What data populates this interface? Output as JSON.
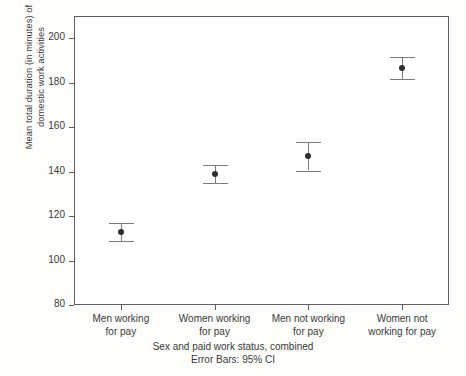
{
  "chart_data": {
    "type": "scatter",
    "title": "",
    "xlabel": "Sex and paid work status, combined",
    "ylabel": "Mean total duration (in minutes) of domestic work activities",
    "ylabel_line1": "Mean total duration (in minutes) of",
    "ylabel_line2": "domestic work activities",
    "error_note": "Error Bars: 95% CI",
    "categories": [
      "Men working\nfor pay",
      "Women working\nfor pay",
      "Men not working\nfor pay",
      "Women not\nworking for pay"
    ],
    "values": [
      113,
      139,
      147,
      186.5
    ],
    "ci_lower": [
      109,
      135,
      140.5,
      181.5
    ],
    "ci_upper": [
      117,
      143,
      153.5,
      191.5
    ],
    "ylim": [
      80,
      210
    ],
    "yticks": [
      80,
      100,
      120,
      140,
      160,
      180,
      200
    ],
    "ytick_labels": [
      "80",
      "100",
      "120",
      "140",
      "160",
      "180",
      "200"
    ],
    "grid": false,
    "legend": "none",
    "marker_color": "#2e2e2e",
    "errorbar_color": "#7b7b7b",
    "axis_color": "#5e5e5e",
    "plot_background": "#ffffff",
    "canvas_background": "#fdfdfc"
  }
}
